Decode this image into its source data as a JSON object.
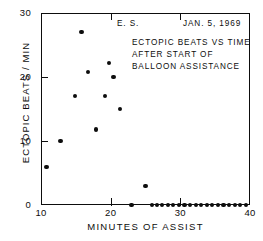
{
  "chart_data": {
    "type": "scatter",
    "title": "",
    "xlabel": "MINUTES OF ASSIST",
    "ylabel": "ECTOPIC BEATS / MIN",
    "xlim": [
      10,
      40
    ],
    "ylim": [
      0,
      30
    ],
    "xticks": [
      10,
      20,
      30,
      40
    ],
    "xtick_labels": [
      "10",
      "20",
      "30",
      "40"
    ],
    "yticks": [
      0,
      10,
      20,
      30
    ],
    "ytick_labels": [
      "0",
      "10",
      "20",
      "30"
    ],
    "grid": false,
    "legend": null,
    "marker": "filled-circle",
    "marker_color": "#0d0d0d",
    "annotations": [
      {
        "id": "subject",
        "text": "E. S."
      },
      {
        "id": "date",
        "text": "JAN. 5, 1969"
      },
      {
        "id": "caption_line_1",
        "text": "ECTOPIC BEATS VS TIME"
      },
      {
        "id": "caption_line_2",
        "text": "AFTER START OF"
      },
      {
        "id": "caption_line_3",
        "text": "BALLOON ASSISTANCE"
      }
    ],
    "points": [
      {
        "x": 10.8,
        "y": 6.0
      },
      {
        "x": 12.8,
        "y": 10.0
      },
      {
        "x": 14.9,
        "y": 17.0
      },
      {
        "x": 15.8,
        "y": 27.0
      },
      {
        "x": 16.8,
        "y": 20.8
      },
      {
        "x": 17.9,
        "y": 11.8
      },
      {
        "x": 19.2,
        "y": 17.0
      },
      {
        "x": 19.8,
        "y": 22.2
      },
      {
        "x": 20.4,
        "y": 20.0
      },
      {
        "x": 21.3,
        "y": 15.0
      },
      {
        "x": 25.0,
        "y": 3.0
      },
      {
        "x": 23.0,
        "y": 0
      },
      {
        "x": 25.9,
        "y": 0
      },
      {
        "x": 26.6,
        "y": 0
      },
      {
        "x": 27.4,
        "y": 0
      },
      {
        "x": 28.2,
        "y": 0
      },
      {
        "x": 29.0,
        "y": 0
      },
      {
        "x": 29.8,
        "y": 0
      },
      {
        "x": 30.6,
        "y": 0
      },
      {
        "x": 31.4,
        "y": 0
      },
      {
        "x": 32.2,
        "y": 0
      },
      {
        "x": 33.0,
        "y": 0
      },
      {
        "x": 33.8,
        "y": 0
      },
      {
        "x": 34.6,
        "y": 0
      },
      {
        "x": 35.4,
        "y": 0
      },
      {
        "x": 36.2,
        "y": 0
      },
      {
        "x": 37.0,
        "y": 0
      },
      {
        "x": 37.8,
        "y": 0
      },
      {
        "x": 38.6,
        "y": 0
      },
      {
        "x": 39.4,
        "y": 0
      }
    ]
  }
}
